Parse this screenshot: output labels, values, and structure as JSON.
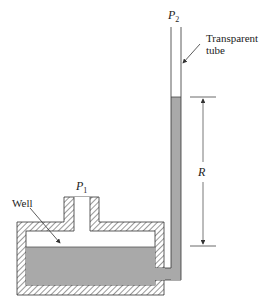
{
  "diagram": {
    "type": "well-type manometer",
    "labels": {
      "p2": "P",
      "p2_sub": "2",
      "p1": "P",
      "p1_sub": "1",
      "tube_line1": "Transparent",
      "tube_line2": "tube",
      "reading": "R",
      "well": "Well"
    },
    "colors": {
      "liquid": "#a9a9a9",
      "outline": "#333333",
      "hatch": "#444444",
      "background": "#ffffff"
    }
  }
}
